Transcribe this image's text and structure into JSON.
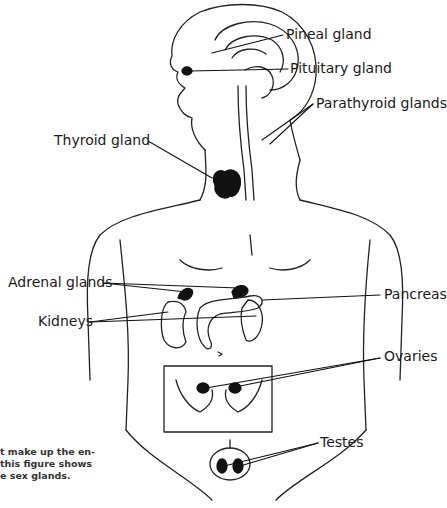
{
  "figure": {
    "labels": {
      "pineal": "Pineal gland",
      "pituitary": "Pituitary gland",
      "parathyroid": "Parathyroid glands",
      "thyroid": "Thyroid gland",
      "adrenal": "Adrenal glands",
      "pancreas": "Pancreas",
      "kidneys": "Kidneys",
      "ovaries": "Ovaries",
      "testes": "Testes"
    },
    "caption_lines": [
      "t make up the en-",
      " this figure shows",
      "e sex glands."
    ]
  }
}
